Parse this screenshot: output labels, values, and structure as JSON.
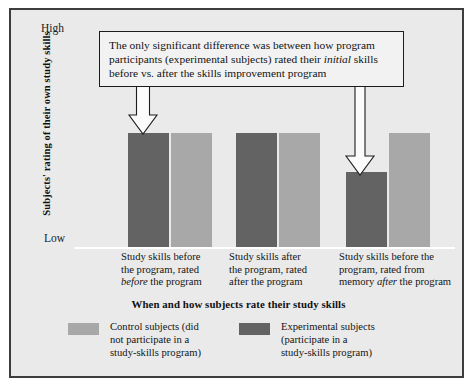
{
  "figure": {
    "background": "#eaeaea",
    "frame_color": "#3d3d3d"
  },
  "callout": {
    "text_part1": "The only significant difference was between how program participants (experimental subjects) rated their ",
    "emphasis": "initial",
    "text_part2": " skills before vs. after the skills improvement program",
    "full_text": "The only significant difference was between how program participants (experimental subjects) rated their initial skills before vs. after the skills improvement program"
  },
  "axis": {
    "y_title": "Subjects' rating of their own study skills",
    "y_high": "High",
    "y_low": "Low",
    "x_title": "When and how subjects rate their study skills"
  },
  "legend": {
    "control": {
      "label": "Control subjects (did\nnot participate in a\nstudy-skills program)",
      "color": "#a8a8a8"
    },
    "experimental": {
      "label": "Experimental subjects\n(participate in a\nstudy-skills program)",
      "color": "#636363"
    }
  },
  "chart_data": {
    "type": "bar",
    "title": "",
    "xlabel": "When and how subjects rate their study skills",
    "ylabel": "Subjects' rating of their own study skills",
    "ylim": [
      0,
      1
    ],
    "ytick_labels": [
      "Low",
      "High"
    ],
    "grid": false,
    "legend_position": "bottom",
    "categories": [
      "Study skills before the program, rated before the program",
      "Study skills after the program, rated after the program",
      "Study skills before the program, rated from memory after the program"
    ],
    "category_lines": [
      [
        "Study skills before",
        "the program, rated",
        "before the program"
      ],
      [
        "Study skills after",
        "the program, rated",
        "after the program"
      ],
      [
        "Study skills before the",
        "program, rated from",
        "memory after the program"
      ]
    ],
    "category_emphasis": [
      "before",
      "",
      "after"
    ],
    "series": [
      {
        "name": "Experimental subjects",
        "color": "#636363",
        "values": [
          0.985,
          0.985,
          0.645
        ]
      },
      {
        "name": "Control subjects",
        "color": "#a8a8a8",
        "values": [
          0.985,
          0.985,
          0.985
        ]
      }
    ],
    "series_order_in_group": [
      "Experimental subjects",
      "Control subjects"
    ],
    "annotations": [
      {
        "name": "arrow-to-group1-experimental-bar",
        "target_group": 0,
        "target_series": "Experimental subjects"
      },
      {
        "name": "arrow-to-group3-experimental-bar",
        "target_group": 2,
        "target_series": "Experimental subjects"
      }
    ]
  },
  "geometry": {
    "baseline_y": 237,
    "bar_width": 41,
    "groups": [
      {
        "dark_x": 117,
        "light_x": 160
      },
      {
        "dark_x": 225,
        "light_x": 268
      },
      {
        "dark_x": 335,
        "light_x": 378
      }
    ]
  }
}
